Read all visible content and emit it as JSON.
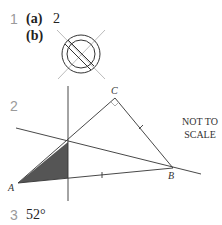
{
  "questions": [
    {
      "number": "1",
      "parts": [
        {
          "label": "(a)",
          "answer": "2"
        },
        {
          "label": "(b)",
          "answer_figure": "circle-with-symmetry-lines"
        }
      ]
    },
    {
      "number": "2",
      "figure": {
        "vertices": {
          "A": "A",
          "B": "B",
          "C": "C"
        },
        "note_line1": "NOT TO",
        "note_line2": "SCALE",
        "shaded_color": "#555555"
      }
    },
    {
      "number": "3",
      "answer": "52°"
    }
  ]
}
